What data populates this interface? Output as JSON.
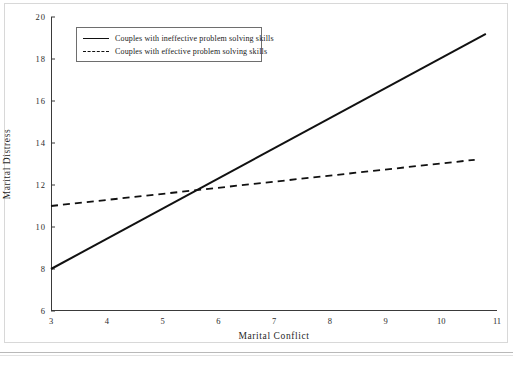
{
  "chart_data": {
    "type": "line",
    "title": "",
    "xlabel": "Marital Conflict",
    "ylabel": "Marital Distress",
    "xlim": [
      3,
      11
    ],
    "ylim": [
      6,
      20
    ],
    "xticks": [
      "3",
      "4",
      "5",
      "6",
      "7",
      "8",
      "9",
      "10",
      "11"
    ],
    "yticks": [
      "6",
      "8",
      "10",
      "12",
      "14",
      "16",
      "18",
      "20"
    ],
    "grid": false,
    "legend_position": "upper left inside",
    "series": [
      {
        "name": "Couples with ineffective problem solving skills",
        "style": "solid",
        "color": "#111111",
        "x": [
          3,
          10.8
        ],
        "y": [
          8.0,
          19.2
        ]
      },
      {
        "name": "Couples with effective problem solving skills",
        "style": "dashed",
        "color": "#111111",
        "x": [
          3,
          10.6
        ],
        "y": [
          11.0,
          13.2
        ]
      }
    ],
    "annotations": {
      "intersection_x": 5.4,
      "intersection_y": 11.6
    }
  },
  "legend": {
    "items": [
      {
        "label": "Couples with ineffective problem solving skills",
        "style": "solid"
      },
      {
        "label": "Couples with effective problem solving skills",
        "style": "dashed"
      }
    ]
  },
  "axes": {
    "x_title": "Marital Conflict",
    "y_title": "Marital Distress"
  },
  "footer": {
    "caption": ""
  }
}
